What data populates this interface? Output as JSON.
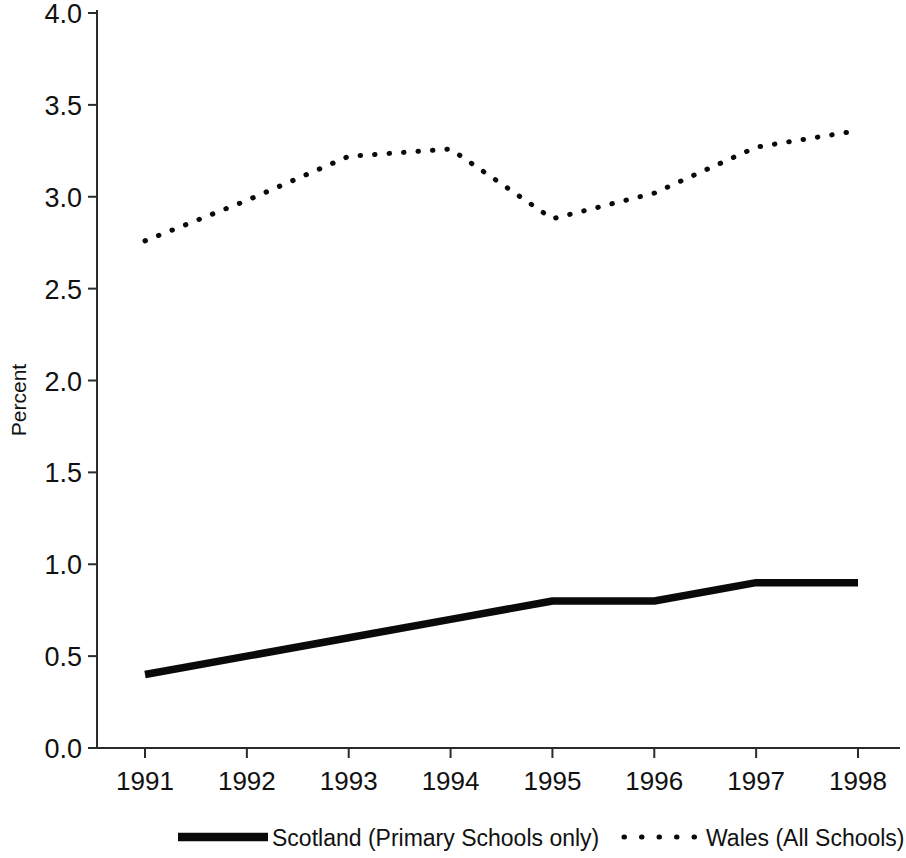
{
  "chart_data": {
    "type": "line",
    "title": "",
    "xlabel": "",
    "ylabel": "Percent",
    "x": [
      1991,
      1992,
      1993,
      1994,
      1995,
      1996,
      1997,
      1998
    ],
    "categories": [
      "1991",
      "1992",
      "1993",
      "1994",
      "1995",
      "1996",
      "1997",
      "1998"
    ],
    "series": [
      {
        "name": "Scotland (Primary Schools only)",
        "style": "solid",
        "values": [
          0.4,
          0.5,
          0.6,
          0.7,
          0.8,
          0.8,
          0.9,
          0.9
        ]
      },
      {
        "name": "Wales (All Schools)",
        "style": "dotted",
        "values": [
          2.76,
          2.98,
          3.22,
          3.26,
          2.88,
          3.02,
          3.27,
          3.36
        ]
      }
    ],
    "ylim": [
      0.0,
      4.0
    ],
    "xlim": [
      1991,
      1998
    ],
    "ytick_labels": [
      "0.0",
      "0.5",
      "1.0",
      "1.5",
      "2.0",
      "2.5",
      "3.0",
      "3.5",
      "4.0"
    ],
    "ytick_values": [
      0.0,
      0.5,
      1.0,
      1.5,
      2.0,
      2.5,
      3.0,
      3.5,
      4.0
    ],
    "xtick_labels": [
      "1991",
      "1992",
      "1993",
      "1994",
      "1995",
      "1996",
      "1997",
      "1998"
    ],
    "grid": false,
    "legend_position": "bottom",
    "line_color": "#0a0a0a",
    "axis_color": "#2b2b2b",
    "background": "#ffffff"
  },
  "legend": {
    "entries": [
      {
        "label": "Scotland (Primary Schools only)",
        "style": "solid"
      },
      {
        "label": "Wales (All Schools)",
        "style": "dotted"
      }
    ]
  },
  "axes": {
    "y_title": "Percent"
  }
}
